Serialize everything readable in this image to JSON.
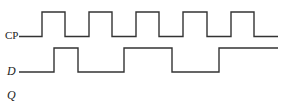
{
  "diagram": {
    "type": "timing-diagram",
    "signals": [
      {
        "name": "CP",
        "label": "CP",
        "italic": false,
        "baseline_y": 36.5,
        "high_y": 12,
        "start_x": 19,
        "end_x": 278,
        "initial": "low",
        "transitions_x": [
          42,
          65,
          89,
          112,
          136,
          159,
          183,
          207,
          231,
          254
        ]
      },
      {
        "name": "D",
        "label": "D",
        "italic": true,
        "baseline_y": 72,
        "high_y": 48,
        "start_x": 19,
        "end_x": 278,
        "initial": "low",
        "transitions_x": [
          54,
          78,
          124,
          172,
          219
        ]
      },
      {
        "name": "Q",
        "label": "Q",
        "italic": true,
        "waveform": "blank (to be drawn)"
      }
    ],
    "stroke_color": "#333333",
    "background": "#ffffff"
  }
}
